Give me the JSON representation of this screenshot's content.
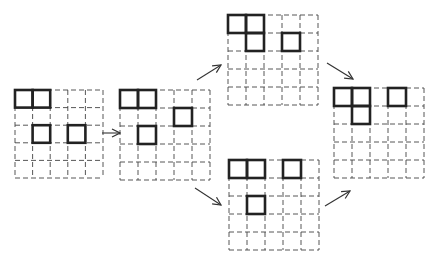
{
  "diagram": {
    "colors": {
      "dashed_grid": "#444444",
      "bold_cell": "#222222",
      "arrow": "#333333",
      "background": "#ffffff"
    },
    "grids": [
      {
        "id": "grid-start",
        "x": 15,
        "y": 90,
        "cols": 5,
        "rows": 5,
        "cell": 17.6,
        "bold": [
          [
            0,
            0
          ],
          [
            0,
            1
          ],
          [
            2,
            1
          ],
          [
            2,
            3
          ]
        ]
      },
      {
        "id": "grid-step2",
        "x": 120,
        "y": 90,
        "cols": 5,
        "rows": 5,
        "cell": 18,
        "bold": [
          [
            0,
            0
          ],
          [
            0,
            1
          ],
          [
            1,
            3
          ],
          [
            2,
            1
          ]
        ]
      },
      {
        "id": "grid-top",
        "x": 228,
        "y": 15,
        "cols": 5,
        "rows": 5,
        "cell": 18,
        "bold": [
          [
            0,
            0
          ],
          [
            0,
            1
          ],
          [
            1,
            1
          ],
          [
            1,
            3
          ]
        ]
      },
      {
        "id": "grid-bottom",
        "x": 229,
        "y": 160,
        "cols": 5,
        "rows": 5,
        "cell": 18,
        "bold": [
          [
            0,
            0
          ],
          [
            0,
            1
          ],
          [
            0,
            3
          ],
          [
            2,
            1
          ]
        ]
      },
      {
        "id": "grid-final",
        "x": 334,
        "y": 88,
        "cols": 5,
        "rows": 5,
        "cell": 18,
        "bold": [
          [
            0,
            0
          ],
          [
            0,
            1
          ],
          [
            0,
            3
          ],
          [
            1,
            1
          ]
        ]
      }
    ],
    "arrows": [
      {
        "id": "arrow-start-to-step2",
        "x1": 102,
        "y1": 133,
        "x2": 120,
        "y2": 133
      },
      {
        "id": "arrow-step2-to-top",
        "x1": 197,
        "y1": 80,
        "x2": 221,
        "y2": 65
      },
      {
        "id": "arrow-step2-to-bottom",
        "x1": 195,
        "y1": 188,
        "x2": 221,
        "y2": 205
      },
      {
        "id": "arrow-top-to-final",
        "x1": 327,
        "y1": 63,
        "x2": 353,
        "y2": 79
      },
      {
        "id": "arrow-bottom-to-final",
        "x1": 325,
        "y1": 206,
        "x2": 350,
        "y2": 191
      }
    ]
  }
}
